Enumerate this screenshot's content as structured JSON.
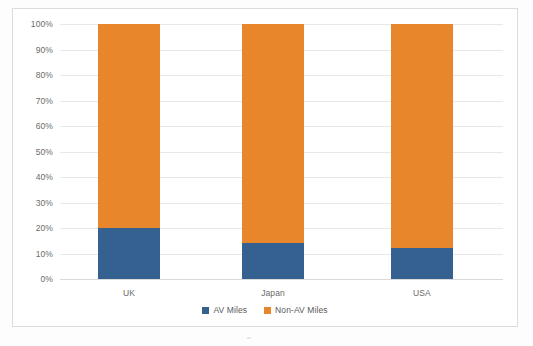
{
  "chart_data": {
    "type": "bar",
    "subtype": "stacked-100-percent",
    "title": "",
    "xlabel": "",
    "ylabel": "",
    "categories": [
      "UK",
      "Japan",
      "USA"
    ],
    "series": [
      {
        "name": "AV Miles",
        "color": "#34618f",
        "values": [
          20,
          14,
          12
        ]
      },
      {
        "name": "Non-AV Miles",
        "color": "#e8862b",
        "values": [
          80,
          86,
          88
        ]
      }
    ],
    "ylim": [
      0,
      100
    ],
    "ytick_labels": [
      "100%",
      "90%",
      "80%",
      "70%",
      "60%",
      "50%",
      "40%",
      "30%",
      "20%",
      "10%",
      "0%"
    ],
    "ytick_values": [
      100,
      90,
      80,
      70,
      60,
      50,
      40,
      30,
      20,
      10,
      0
    ],
    "grid": true,
    "legend_position": "bottom",
    "legend_entries": [
      "AV Miles",
      "Non-AV Miles"
    ]
  },
  "colors": {
    "av_miles": "#34618f",
    "non_av_miles": "#e8862b",
    "gridline": "#e8e8e8",
    "frame_border": "#dcdcdc",
    "tick_text": "#6b6b6b",
    "legend_text": "#5a5a5a"
  }
}
